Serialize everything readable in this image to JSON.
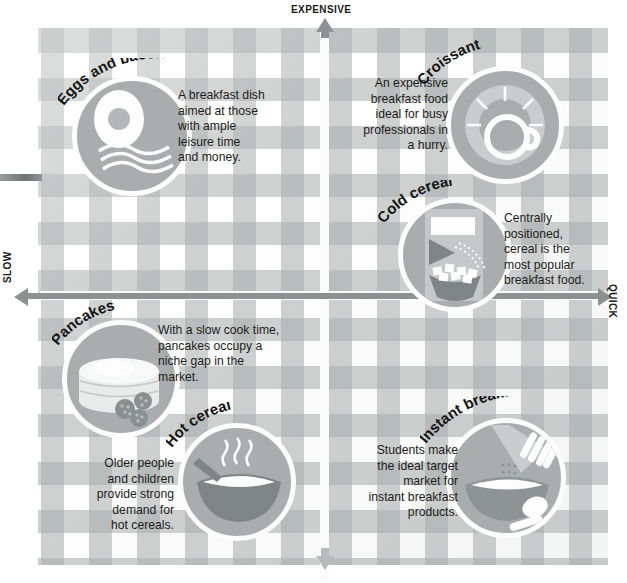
{
  "diagram": {
    "type": "2x2-positioning-matrix",
    "axes": {
      "vertical_top": "EXPENSIVE",
      "vertical_bottom": "",
      "horizontal_left": "SLOW",
      "horizontal_right": "QUICK"
    }
  },
  "items": [
    {
      "id": "eggs-and-bacon",
      "title": "Eggs and bacon",
      "quadrant": "expensive-slow",
      "caption": "A breakfast dish aimed at those with ample leisure time and money.",
      "caption_lines": [
        "A breakfast dish",
        "aimed at those",
        "with ample",
        "leisure time",
        "and money."
      ],
      "icon": "fried-egg-and-bacon-icon"
    },
    {
      "id": "croissant",
      "title": "Croissant",
      "quadrant": "expensive-quick",
      "caption": "An expensive breakfast food ideal for busy professionals in a hurry.",
      "caption_lines": [
        "An expensive",
        "breakfast food",
        "ideal for busy",
        "professionals in",
        "a hurry."
      ],
      "icon": "croissant-and-coffee-cup-icon"
    },
    {
      "id": "cold-cereal",
      "title": "Cold cereal",
      "quadrant": "center-quick",
      "caption": "Centrally positioned, cereal is the most popular breakfast food.",
      "caption_lines": [
        "Centrally",
        "positioned,",
        "cereal is the",
        "most popular",
        "breakfast food."
      ],
      "icon": "cereal-box-pouring-into-bowl-icon"
    },
    {
      "id": "pancakes",
      "title": "Pancakes",
      "quadrant": "cheap-slow",
      "caption": "With a slow cook time, pancakes occupy a niche gap in the market.",
      "caption_lines": [
        "With a slow cook time,",
        "pancakes occupy a",
        "niche gap in the",
        "market."
      ],
      "icon": "pancake-stack-with-berries-icon"
    },
    {
      "id": "hot-cereal",
      "title": "Hot cereal",
      "quadrant": "cheap-slow",
      "caption": "Older people and children provide strong demand for hot cereals.",
      "caption_lines": [
        "Older people",
        "and children",
        "provide strong",
        "demand for",
        "hot cereals."
      ],
      "icon": "steaming-bowl-with-spoon-icon"
    },
    {
      "id": "instant-breakfast",
      "title": "Instant breakfast",
      "quadrant": "cheap-quick",
      "caption": "Students make the ideal target market for instant breakfast products.",
      "caption_lines": [
        "Students make",
        "the ideal target",
        "market for",
        "instant breakfast",
        "products."
      ],
      "icon": "hand-pouring-sachet-into-bowl-icon"
    }
  ],
  "colors": {
    "cloth_check": "#a8acac",
    "cloth_base": "#ffffff",
    "disc_fill": "#a9adad",
    "disc_ring": "#fdfdfd",
    "axis_arrow": "#8d9191",
    "text": "#1a1a1a"
  }
}
